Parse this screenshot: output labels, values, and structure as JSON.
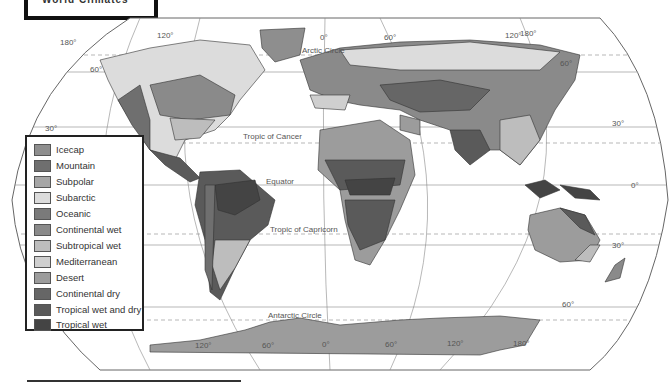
{
  "title": {
    "text": "World Climates"
  },
  "map": {
    "graticule_labels": {
      "top_longitudes": [
        "180°",
        "120°",
        "60°",
        "0°",
        "60°",
        "120°",
        "180°"
      ],
      "bottom_longitudes": [
        "120°",
        "60°",
        "0°",
        "60°",
        "120°",
        "180°"
      ],
      "left_lat_60": "60°",
      "left_lat_30": "30°",
      "right_lat_60n": "60°",
      "right_lat_30n": "30°",
      "right_lat_0": "0°",
      "right_lat_30s": "30°",
      "right_lat_60s": "60°"
    },
    "reference_lines": {
      "arctic": "Arctic Circle",
      "cancer": "Tropic of Cancer",
      "equator": "Equator",
      "capricorn": "Tropic of Capricorn",
      "antarctic": "Antarctic Circle"
    }
  },
  "legend": {
    "items": [
      {
        "label": "Icecap",
        "color": "#8e8e8e"
      },
      {
        "label": "Mountain",
        "color": "#6f6f6f"
      },
      {
        "label": "Subpolar",
        "color": "#a6a6a6"
      },
      {
        "label": "Subarctic",
        "color": "#dcdcdc"
      },
      {
        "label": "Oceanic",
        "color": "#7a7a7a"
      },
      {
        "label": "Continental wet",
        "color": "#8a8a8a"
      },
      {
        "label": "Subtropical wet",
        "color": "#bdbdbd"
      },
      {
        "label": "Mediterranean",
        "color": "#cfcfcf"
      },
      {
        "label": "Desert",
        "color": "#9c9c9c"
      },
      {
        "label": "Continental dry",
        "color": "#666666"
      },
      {
        "label": "Tropical wet and dry",
        "color": "#5a5a5a"
      },
      {
        "label": "Tropical wet",
        "color": "#444444"
      }
    ]
  }
}
